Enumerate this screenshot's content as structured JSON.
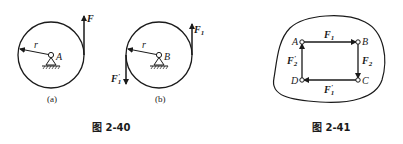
{
  "figure_2_40": {
    "caption": "图 2-40",
    "subfigures": [
      {
        "tag": "(a)",
        "pivot_label": "A",
        "radius_label": "r",
        "forces": [
          {
            "label": "F",
            "prime": "",
            "sub": "",
            "direction": "up",
            "side": "right"
          }
        ]
      },
      {
        "tag": "(b)",
        "pivot_label": "B",
        "radius_label": "r",
        "forces": [
          {
            "label": "F",
            "sub": "1",
            "prime": "",
            "direction": "up",
            "side": "right"
          },
          {
            "label": "F",
            "sub": "1",
            "prime": "′",
            "direction": "down",
            "side": "left"
          }
        ]
      }
    ]
  },
  "figure_2_41": {
    "caption": "图 2-41",
    "points": [
      "A",
      "B",
      "C",
      "D"
    ],
    "forces": [
      {
        "label": "F",
        "sub": "1",
        "prime": "",
        "from": "A",
        "to": "B"
      },
      {
        "label": "F",
        "sub": "2",
        "prime": "",
        "from": "B",
        "to": "C"
      },
      {
        "label": "F",
        "sub": "1",
        "prime": "′",
        "from": "C",
        "to": "D"
      },
      {
        "label": "F",
        "sub": "2",
        "prime": "′",
        "from": "D",
        "to": "A"
      }
    ]
  },
  "colors": {
    "ink": "#1a1a1a",
    "background": "#ffffff"
  }
}
